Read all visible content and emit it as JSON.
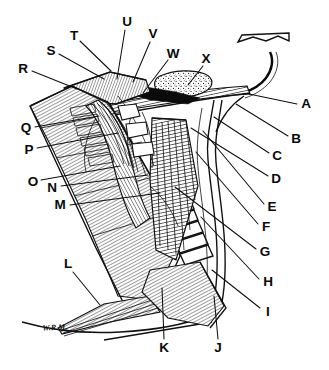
{
  "figure": {
    "type": "labeled anatomical illustration",
    "style": "black ink line drawing with hatching and stippling on white background",
    "background_color": "#ffffff",
    "ink_color": "#0d0d0d",
    "label_count": 24,
    "signature": "W.R.M."
  },
  "labels": [
    {
      "id": "A",
      "text": "A",
      "x": 306,
      "y": 104,
      "line": {
        "x1": 297,
        "y1": 104,
        "x2": 249,
        "y2": 94
      }
    },
    {
      "id": "B",
      "text": "B",
      "x": 296,
      "y": 139,
      "line": {
        "x1": 288,
        "y1": 136,
        "x2": 236,
        "y2": 104
      }
    },
    {
      "id": "C",
      "text": "C",
      "x": 277,
      "y": 156,
      "line": {
        "x1": 269,
        "y1": 153,
        "x2": 214,
        "y2": 117
      }
    },
    {
      "id": "D",
      "text": "D",
      "x": 276,
      "y": 179,
      "line": {
        "x1": 268,
        "y1": 176,
        "x2": 191,
        "y2": 128
      }
    },
    {
      "id": "E",
      "text": "E",
      "x": 272,
      "y": 207,
      "line": {
        "x1": 264,
        "y1": 204,
        "x2": 203,
        "y2": 131
      }
    },
    {
      "id": "F",
      "text": "F",
      "x": 266,
      "y": 227,
      "line": {
        "x1": 258,
        "y1": 224,
        "x2": 196,
        "y2": 152
      }
    },
    {
      "id": "G",
      "text": "G",
      "x": 265,
      "y": 252,
      "line": {
        "x1": 256,
        "y1": 249,
        "x2": 175,
        "y2": 187
      }
    },
    {
      "id": "H",
      "text": "H",
      "x": 268,
      "y": 282,
      "line": {
        "x1": 259,
        "y1": 279,
        "x2": 201,
        "y2": 217
      }
    },
    {
      "id": "I",
      "text": "I",
      "x": 268,
      "y": 312,
      "line": {
        "x1": 260,
        "y1": 308,
        "x2": 212,
        "y2": 270
      }
    },
    {
      "id": "J",
      "text": "J",
      "x": 218,
      "y": 348,
      "line": {
        "x1": 218,
        "y1": 339,
        "x2": 214,
        "y2": 296
      }
    },
    {
      "id": "K",
      "text": "K",
      "x": 164,
      "y": 348,
      "line": {
        "x1": 164,
        "y1": 339,
        "x2": 162,
        "y2": 288
      }
    },
    {
      "id": "L",
      "text": "L",
      "x": 68,
      "y": 264,
      "line": {
        "x1": 73,
        "y1": 272,
        "x2": 100,
        "y2": 305
      }
    },
    {
      "id": "M",
      "text": "M",
      "x": 60,
      "y": 205,
      "line": {
        "x1": 70,
        "y1": 205,
        "x2": 160,
        "y2": 193
      }
    },
    {
      "id": "N",
      "text": "N",
      "x": 52,
      "y": 188,
      "line": {
        "x1": 61,
        "y1": 186,
        "x2": 148,
        "y2": 175
      }
    },
    {
      "id": "O",
      "text": "O",
      "x": 33,
      "y": 182,
      "line": {
        "x1": 41,
        "y1": 180,
        "x2": 120,
        "y2": 166
      }
    },
    {
      "id": "P",
      "text": "P",
      "x": 29,
      "y": 150,
      "line": {
        "x1": 37,
        "y1": 148,
        "x2": 118,
        "y2": 133
      }
    },
    {
      "id": "Q",
      "text": "Q",
      "x": 26,
      "y": 128,
      "line": {
        "x1": 35,
        "y1": 127,
        "x2": 99,
        "y2": 116
      }
    },
    {
      "id": "R",
      "text": "R",
      "x": 23,
      "y": 69,
      "line": {
        "x1": 32,
        "y1": 71,
        "x2": 77,
        "y2": 89
      }
    },
    {
      "id": "S",
      "text": "S",
      "x": 51,
      "y": 51,
      "line": {
        "x1": 59,
        "y1": 54,
        "x2": 104,
        "y2": 79
      }
    },
    {
      "id": "T",
      "text": "T",
      "x": 74,
      "y": 36,
      "line": {
        "x1": 80,
        "y1": 41,
        "x2": 111,
        "y2": 71
      }
    },
    {
      "id": "U",
      "text": "U",
      "x": 127,
      "y": 22,
      "line": {
        "x1": 125,
        "y1": 30,
        "x2": 117,
        "y2": 79
      }
    },
    {
      "id": "V",
      "text": "V",
      "x": 153,
      "y": 34,
      "line": {
        "x1": 150,
        "y1": 42,
        "x2": 133,
        "y2": 82
      }
    },
    {
      "id": "W",
      "text": "W",
      "x": 173,
      "y": 54,
      "line": {
        "x1": 168,
        "y1": 60,
        "x2": 143,
        "y2": 93
      }
    },
    {
      "id": "X",
      "text": "X",
      "x": 206,
      "y": 59,
      "line": {
        "x1": 203,
        "y1": 66,
        "x2": 188,
        "y2": 85
      }
    }
  ],
  "signature": {
    "text": "W.R.M.",
    "x": 55,
    "y": 330
  }
}
